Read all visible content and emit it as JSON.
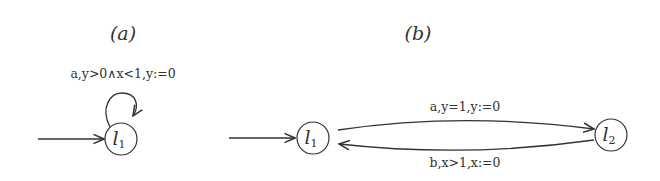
{
  "diagrams": [
    {
      "caption": "(a)",
      "nodes": [
        {
          "id": "l1",
          "label": "l",
          "subscript": "1",
          "initial": true
        }
      ],
      "edges": [
        {
          "from": "l1",
          "to": "l1",
          "label": "a,y>0∧x<1,y:=0",
          "type": "self-loop"
        }
      ]
    },
    {
      "caption": "(b)",
      "nodes": [
        {
          "id": "l1",
          "label": "l",
          "subscript": "1",
          "initial": true
        },
        {
          "id": "l2",
          "label": "l",
          "subscript": "2",
          "initial": false
        }
      ],
      "edges": [
        {
          "from": "l1",
          "to": "l2",
          "label": "a,y=1,y:=0"
        },
        {
          "from": "l2",
          "to": "l1",
          "label": "b,x>1,x:=0"
        }
      ]
    }
  ]
}
